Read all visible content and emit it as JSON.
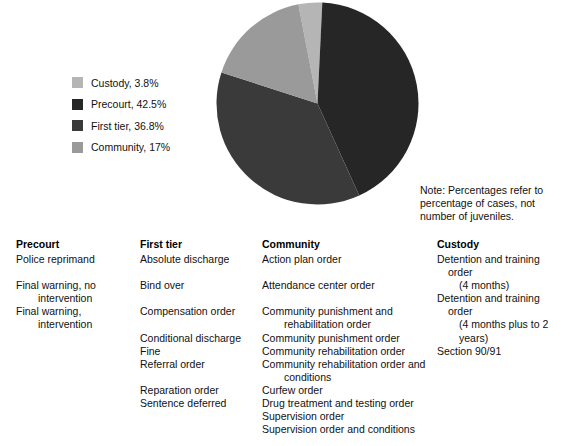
{
  "chart_data": {
    "type": "pie",
    "title": "",
    "labels": [
      "Custody",
      "Precourt",
      "First tier",
      "Community"
    ],
    "values": [
      3.8,
      42.5,
      36.8,
      17
    ],
    "value_unit": "%",
    "colors": [
      "#b5b5b5",
      "#262626",
      "#3a3a3a",
      "#9a9a9a"
    ],
    "legend_position": "left",
    "legend_entries": [
      {
        "label": "Custody, 3.8%",
        "color": "#b5b5b5"
      },
      {
        "label": "Precourt, 42.5%",
        "color": "#262626"
      },
      {
        "label": "First tier, 36.8%",
        "color": "#3a3a3a"
      },
      {
        "label": "Community, 17%",
        "color": "#9a9a9a"
      }
    ],
    "note": "Note: Percentages refer to percentage of cases, not number of juveniles."
  },
  "note": {
    "text": "Note: Percentages refer to percentage of cases, not number of juveniles."
  },
  "columns": {
    "precourt": {
      "heading": "Precourt",
      "items": [
        {
          "text": "Police reprimand",
          "gap_before": 0
        },
        {
          "text": "Final warning, no",
          "cont": "intervention",
          "gap_before": 1
        },
        {
          "text": "Final warning,",
          "cont": "intervention",
          "gap_before": 0
        }
      ]
    },
    "first_tier": {
      "heading": "First tier",
      "items": [
        {
          "text": "Absolute discharge",
          "gap_before": 0
        },
        {
          "text": "Bind over",
          "gap_before": 1
        },
        {
          "text": "Compensation order",
          "gap_before": 1
        },
        {
          "text": "Conditional discharge",
          "gap_before": 1
        },
        {
          "text": "Fine",
          "gap_before": 0
        },
        {
          "text": "Referral order",
          "gap_before": 0
        },
        {
          "text": "Reparation order",
          "gap_before": 1
        },
        {
          "text": "Sentence deferred",
          "gap_before": 0
        }
      ]
    },
    "community": {
      "heading": "Community",
      "items": [
        {
          "text": "Action plan order",
          "gap_before": 0
        },
        {
          "text": "Attendance center order",
          "gap_before": 1
        },
        {
          "text": "Community punishment and",
          "cont": "rehabilitation order",
          "gap_before": 1
        },
        {
          "text": "Community punishment order",
          "gap_before": 0
        },
        {
          "text": "Community rehabilitation order",
          "gap_before": 0
        },
        {
          "text": "Community rehabilitation order and",
          "cont": "conditions",
          "gap_before": 0
        },
        {
          "text": "Curfew order",
          "gap_before": 0
        },
        {
          "text": "Drug treatment and testing order",
          "gap_before": 0
        },
        {
          "text": "Supervision order",
          "gap_before": 0
        },
        {
          "text": "Supervision order and conditions",
          "gap_before": 0
        }
      ]
    },
    "custody": {
      "heading": "Custody",
      "items": [
        {
          "text": "Detention and training order",
          "cont": "(4 months)",
          "gap_before": 0
        },
        {
          "text": "Detention and training order",
          "cont": "(4 months plus to 2 years)",
          "gap_before": 0
        },
        {
          "text": "Section 90/91",
          "gap_before": 0
        }
      ]
    }
  }
}
